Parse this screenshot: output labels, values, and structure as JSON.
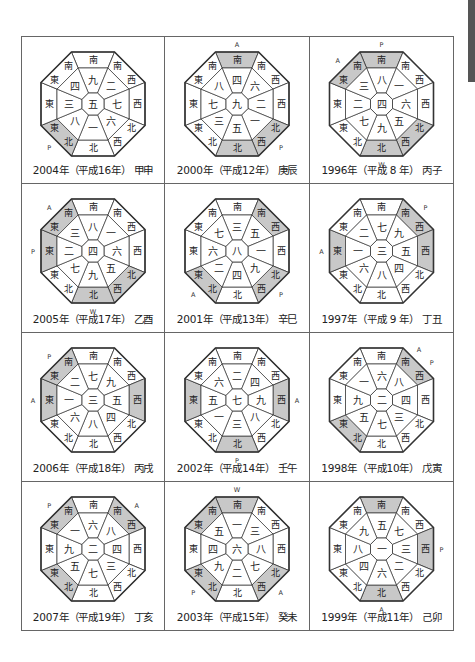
{
  "labels": {
    "directions": {
      "S": [
        "南"
      ],
      "SE": [
        "南",
        "東"
      ],
      "E": [
        "東"
      ],
      "NE": [
        "東",
        "北"
      ],
      "N": [
        "北"
      ],
      "NW": [
        "北",
        "西"
      ],
      "W": [
        "西"
      ],
      "SW": [
        "南",
        "西"
      ]
    }
  },
  "style": {
    "shade_color": "#c8c8c8",
    "line_color": "#333333",
    "fill_color": "#ffffff"
  },
  "charts": [
    {
      "caption": "2004年（平成16年） 甲申",
      "center": "五",
      "sectors": {
        "S": "九",
        "SE": "四",
        "E": "三",
        "NE": "八",
        "N": "一",
        "NW": "六",
        "W": "七",
        "SW": "二"
      },
      "shaded": [
        "NE"
      ],
      "markers": [
        {
          "text": "P",
          "pos": "NE"
        }
      ]
    },
    {
      "caption": "2000年（平成12年） 庚辰",
      "center": "九",
      "sectors": {
        "S": "四",
        "SE": "八",
        "E": "七",
        "NE": "三",
        "N": "五",
        "NW": "一",
        "W": "二",
        "SW": "六"
      },
      "shaded": [
        "S",
        "N",
        "NW"
      ],
      "markers": [
        {
          "text": "A",
          "pos": "S"
        },
        {
          "text": "P",
          "pos": "NW"
        }
      ]
    },
    {
      "caption": "1996年（平成 8 年） 丙子",
      "center": "四",
      "sectors": {
        "S": "八",
        "SE": "三",
        "E": "二",
        "NE": "七",
        "N": "九",
        "NW": "五",
        "W": "六",
        "SW": "一"
      },
      "shaded": [
        "S",
        "SE",
        "N",
        "NW"
      ],
      "markers": [
        {
          "text": "P",
          "pos": "S"
        },
        {
          "text": "A",
          "pos": "SE"
        },
        {
          "text": "W",
          "pos": "N"
        }
      ]
    },
    {
      "caption": "2005年（平成17年） 乙酉",
      "center": "四",
      "sectors": {
        "S": "八",
        "SE": "三",
        "E": "二",
        "NE": "七",
        "N": "九",
        "NW": "五",
        "W": "六",
        "SW": "一"
      },
      "shaded": [
        "SE",
        "E",
        "N",
        "NW"
      ],
      "markers": [
        {
          "text": "A",
          "pos": "SE"
        },
        {
          "text": "P",
          "pos": "E"
        },
        {
          "text": "W",
          "pos": "N"
        }
      ]
    },
    {
      "caption": "2001年（平成13年） 辛巳",
      "center": "八",
      "sectors": {
        "S": "三",
        "SE": "七",
        "E": "六",
        "NE": "二",
        "N": "四",
        "NW": "九",
        "W": "一",
        "SW": "五"
      },
      "shaded": [
        "SW",
        "NE",
        "NW"
      ],
      "markers": [
        {
          "text": "A",
          "pos": "NE"
        },
        {
          "text": "P",
          "pos": "NW"
        }
      ]
    },
    {
      "caption": "1997年（平成 9 年） 丁丑",
      "center": "三",
      "sectors": {
        "S": "七",
        "SE": "二",
        "E": "一",
        "NE": "六",
        "N": "八",
        "NW": "四",
        "W": "五",
        "SW": "九"
      },
      "shaded": [
        "SW",
        "E",
        "W"
      ],
      "markers": [
        {
          "text": "P",
          "pos": "SW"
        },
        {
          "text": "A",
          "pos": "E"
        }
      ]
    },
    {
      "caption": "2006年（平成18年） 丙戌",
      "center": "三",
      "sectors": {
        "S": "七",
        "SE": "二",
        "E": "一",
        "NE": "六",
        "N": "八",
        "NW": "四",
        "W": "五",
        "SW": "九"
      },
      "shaded": [
        "SE",
        "E",
        "W"
      ],
      "markers": [
        {
          "text": "P",
          "pos": "SE"
        },
        {
          "text": "A",
          "pos": "E"
        }
      ]
    },
    {
      "caption": "2002年（平成14年） 壬午",
      "center": "七",
      "sectors": {
        "S": "二",
        "SE": "六",
        "E": "五",
        "NE": "一",
        "N": "三",
        "NW": "八",
        "W": "九",
        "SW": "四"
      },
      "shaded": [
        "E",
        "W",
        "N"
      ],
      "markers": [
        {
          "text": "A",
          "pos": "W"
        },
        {
          "text": "P",
          "pos": "N"
        }
      ]
    },
    {
      "caption": "1998年（平成10年） 戊寅",
      "center": "二",
      "sectors": {
        "S": "六",
        "SE": "一",
        "E": "九",
        "NE": "五",
        "N": "七",
        "NW": "三",
        "W": "四",
        "SW": "八"
      },
      "shaded": [
        "SW",
        "NE"
      ],
      "markers": [
        {
          "text": "A",
          "pos": "SW1"
        },
        {
          "text": "P",
          "pos": "SW2"
        }
      ]
    },
    {
      "caption": "2007年（平成19年） 丁亥",
      "center": "二",
      "sectors": {
        "S": "六",
        "SE": "一",
        "E": "九",
        "NE": "五",
        "N": "七",
        "NW": "三",
        "W": "四",
        "SW": "八"
      },
      "shaded": [
        "SE",
        "SW",
        "NE"
      ],
      "markers": [
        {
          "text": "P",
          "pos": "SE"
        },
        {
          "text": "A",
          "pos": "SW"
        }
      ]
    },
    {
      "caption": "2003年（平成15年） 癸未",
      "center": "六",
      "sectors": {
        "S": "一",
        "SE": "五",
        "E": "四",
        "NE": "九",
        "N": "二",
        "NW": "七",
        "W": "八",
        "SW": "三"
      },
      "shaded": [
        "S",
        "SE",
        "NE",
        "NW"
      ],
      "markers": [
        {
          "text": "W",
          "pos": "S"
        },
        {
          "text": "P",
          "pos": "NE"
        },
        {
          "text": "A",
          "pos": "NW"
        }
      ]
    },
    {
      "caption": "1999年（平成11年） 己卯",
      "center": "一",
      "sectors": {
        "S": "五",
        "SE": "九",
        "E": "八",
        "NE": "四",
        "N": "六",
        "NW": "二",
        "W": "三",
        "SW": "七"
      },
      "shaded": [
        "S",
        "W",
        "N"
      ],
      "markers": [
        {
          "text": "P",
          "pos": "W"
        },
        {
          "text": "A",
          "pos": "N"
        }
      ]
    }
  ]
}
